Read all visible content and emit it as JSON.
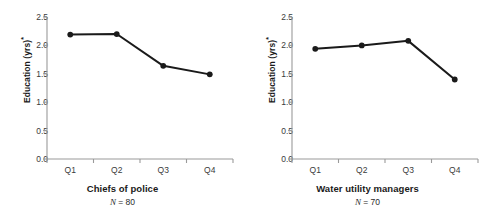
{
  "figure": {
    "background": "#ffffff",
    "axis_color": "#9a9a9a",
    "series_color": "#1a1a1a",
    "panel_count": 2
  },
  "chart_data": [
    {
      "type": "line",
      "title": "Chiefs of police",
      "subtitle": "N = 80",
      "subtitle_var": "N",
      "subtitle_rest": " = 80",
      "sample_size": 80,
      "xlabel": "Chiefs of police",
      "ylabel": "Education (yrs)",
      "ylabel_super": "*",
      "categories": [
        "Q1",
        "Q2",
        "Q3",
        "Q4"
      ],
      "values": [
        2.19,
        2.2,
        1.64,
        1.49
      ],
      "ylim": [
        0.0,
        2.5
      ],
      "yticks": [
        0.0,
        0.5,
        1.0,
        1.5,
        2.0,
        2.5
      ],
      "ytick_labels": [
        "0.0",
        "0.5",
        "1.0",
        "1.5",
        "2.0",
        "2.5"
      ],
      "grid": false,
      "legend": "none",
      "marker": "filled-circle"
    },
    {
      "type": "line",
      "title": "Water utility managers",
      "subtitle": "N = 70",
      "subtitle_var": "N",
      "subtitle_rest": " = 70",
      "sample_size": 70,
      "xlabel": "Water utility managers",
      "ylabel": "Education (yrs)",
      "ylabel_super": "*",
      "categories": [
        "Q1",
        "Q2",
        "Q3",
        "Q4"
      ],
      "values": [
        1.94,
        2.0,
        2.08,
        1.4
      ],
      "ylim": [
        0.0,
        2.5
      ],
      "yticks": [
        0.0,
        0.5,
        1.0,
        1.5,
        2.0,
        2.5
      ],
      "ytick_labels": [
        "0.0",
        "0.5",
        "1.0",
        "1.5",
        "2.0",
        "2.5"
      ],
      "grid": false,
      "legend": "none",
      "marker": "filled-circle"
    }
  ]
}
